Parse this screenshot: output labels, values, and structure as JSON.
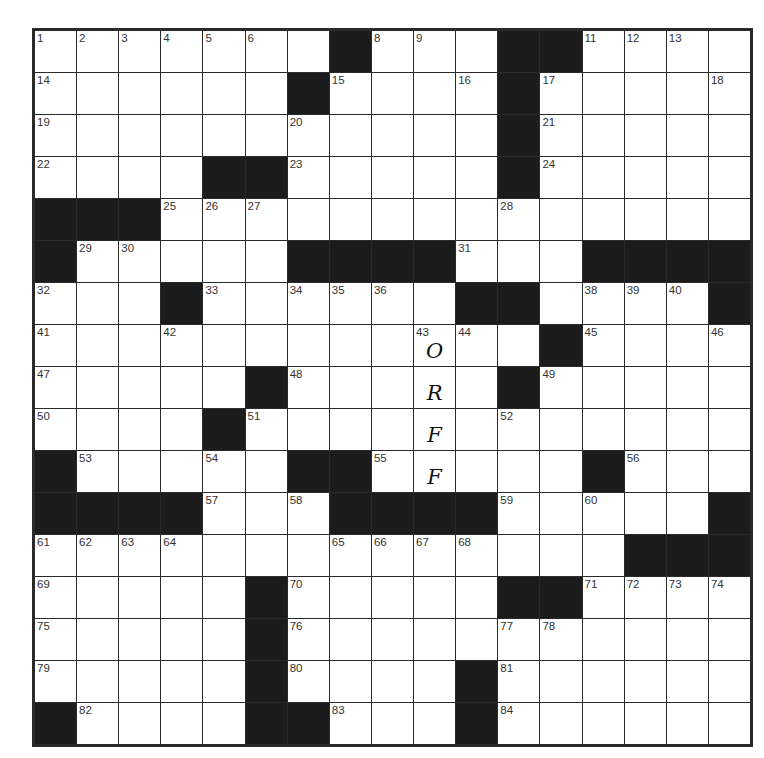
{
  "puzzle": {
    "rows": 17,
    "cols": 17,
    "colors": {
      "block": "#1c1c1c",
      "cell": "#ffffff",
      "line": "#2a2a2a"
    },
    "layout": [
      ".......#...##....#",
      "......#....#.....",
      "...........#.....",
      "....##.....#.....",
      "###..............",
      "#.....####...####",
      "...#......##....#",
      "............#....",
      ".....#.....#.....",
      "....#............",
      "#.....##.....#...",
      "####...####.....#",
      "..............###",
      ".....#.....##....",
      ".....#...........",
      ".....#....#......",
      "#....##...#......"
    ],
    "numbers": [
      {
        "r": 0,
        "c": 0,
        "n": "1"
      },
      {
        "r": 0,
        "c": 1,
        "n": "2"
      },
      {
        "r": 0,
        "c": 2,
        "n": "3"
      },
      {
        "r": 0,
        "c": 3,
        "n": "4"
      },
      {
        "r": 0,
        "c": 4,
        "n": "5"
      },
      {
        "r": 0,
        "c": 5,
        "n": "6"
      },
      {
        "r": 0,
        "c": 7,
        "n": "7"
      },
      {
        "r": 0,
        "c": 8,
        "n": "8"
      },
      {
        "r": 0,
        "c": 9,
        "n": "9"
      },
      {
        "r": 0,
        "c": 12,
        "n": "10"
      },
      {
        "r": 0,
        "c": 13,
        "n": "11"
      },
      {
        "r": 0,
        "c": 14,
        "n": "12"
      },
      {
        "r": 0,
        "c": 15,
        "n": "13"
      },
      {
        "r": 1,
        "c": 0,
        "n": "14"
      },
      {
        "r": 1,
        "c": 7,
        "n": "15"
      },
      {
        "r": 1,
        "c": 10,
        "n": "16"
      },
      {
        "r": 1,
        "c": 12,
        "n": "17"
      },
      {
        "r": 1,
        "c": 16,
        "n": "18"
      },
      {
        "r": 2,
        "c": 0,
        "n": "19"
      },
      {
        "r": 2,
        "c": 6,
        "n": "20"
      },
      {
        "r": 2,
        "c": 12,
        "n": "21"
      },
      {
        "r": 3,
        "c": 0,
        "n": "22"
      },
      {
        "r": 3,
        "c": 6,
        "n": "23"
      },
      {
        "r": 3,
        "c": 12,
        "n": "24"
      },
      {
        "r": 4,
        "c": 3,
        "n": "25"
      },
      {
        "r": 4,
        "c": 4,
        "n": "26"
      },
      {
        "r": 4,
        "c": 5,
        "n": "27"
      },
      {
        "r": 4,
        "c": 11,
        "n": "28"
      },
      {
        "r": 5,
        "c": 1,
        "n": "29"
      },
      {
        "r": 5,
        "c": 2,
        "n": "30"
      },
      {
        "r": 5,
        "c": 10,
        "n": "31"
      },
      {
        "r": 6,
        "c": 0,
        "n": "32"
      },
      {
        "r": 6,
        "c": 4,
        "n": "33"
      },
      {
        "r": 6,
        "c": 6,
        "n": "34"
      },
      {
        "r": 6,
        "c": 7,
        "n": "35"
      },
      {
        "r": 6,
        "c": 8,
        "n": "36"
      },
      {
        "r": 6,
        "c": 11,
        "n": "37"
      },
      {
        "r": 6,
        "c": 13,
        "n": "38"
      },
      {
        "r": 6,
        "c": 14,
        "n": "39"
      },
      {
        "r": 6,
        "c": 15,
        "n": "40"
      },
      {
        "r": 7,
        "c": 0,
        "n": "41"
      },
      {
        "r": 7,
        "c": 3,
        "n": "42"
      },
      {
        "r": 7,
        "c": 9,
        "n": "43"
      },
      {
        "r": 7,
        "c": 10,
        "n": "44"
      },
      {
        "r": 7,
        "c": 13,
        "n": "45"
      },
      {
        "r": 7,
        "c": 16,
        "n": "46"
      },
      {
        "r": 8,
        "c": 0,
        "n": "47"
      },
      {
        "r": 8,
        "c": 6,
        "n": "48"
      },
      {
        "r": 8,
        "c": 12,
        "n": "49"
      },
      {
        "r": 9,
        "c": 0,
        "n": "50"
      },
      {
        "r": 9,
        "c": 5,
        "n": "51"
      },
      {
        "r": 9,
        "c": 11,
        "n": "52"
      },
      {
        "r": 10,
        "c": 1,
        "n": "53"
      },
      {
        "r": 10,
        "c": 4,
        "n": "54"
      },
      {
        "r": 10,
        "c": 8,
        "n": "55"
      },
      {
        "r": 10,
        "c": 14,
        "n": "56"
      },
      {
        "r": 11,
        "c": 4,
        "n": "57"
      },
      {
        "r": 11,
        "c": 6,
        "n": "58"
      },
      {
        "r": 11,
        "c": 11,
        "n": "59"
      },
      {
        "r": 11,
        "c": 13,
        "n": "60"
      },
      {
        "r": 12,
        "c": 0,
        "n": "61"
      },
      {
        "r": 12,
        "c": 1,
        "n": "62"
      },
      {
        "r": 12,
        "c": 2,
        "n": "63"
      },
      {
        "r": 12,
        "c": 3,
        "n": "64"
      },
      {
        "r": 12,
        "c": 7,
        "n": "65"
      },
      {
        "r": 12,
        "c": 8,
        "n": "66"
      },
      {
        "r": 12,
        "c": 9,
        "n": "67"
      },
      {
        "r": 12,
        "c": 10,
        "n": "68"
      },
      {
        "r": 13,
        "c": 0,
        "n": "69"
      },
      {
        "r": 13,
        "c": 6,
        "n": "70"
      },
      {
        "r": 13,
        "c": 13,
        "n": "71"
      },
      {
        "r": 13,
        "c": 14,
        "n": "72"
      },
      {
        "r": 13,
        "c": 15,
        "n": "73"
      },
      {
        "r": 13,
        "c": 16,
        "n": "74"
      },
      {
        "r": 14,
        "c": 0,
        "n": "75"
      },
      {
        "r": 14,
        "c": 6,
        "n": "76"
      },
      {
        "r": 14,
        "c": 11,
        "n": "77"
      },
      {
        "r": 14,
        "c": 12,
        "n": "78"
      },
      {
        "r": 15,
        "c": 0,
        "n": "79"
      },
      {
        "r": 15,
        "c": 6,
        "n": "80"
      },
      {
        "r": 15,
        "c": 11,
        "n": "81"
      },
      {
        "r": 16,
        "c": 1,
        "n": "82"
      },
      {
        "r": 16,
        "c": 7,
        "n": "83"
      },
      {
        "r": 16,
        "c": 11,
        "n": "84"
      }
    ],
    "entries": [
      {
        "r": 7,
        "c": 9,
        "letter": "O"
      },
      {
        "r": 8,
        "c": 9,
        "letter": "R"
      },
      {
        "r": 9,
        "c": 9,
        "letter": "F"
      },
      {
        "r": 10,
        "c": 9,
        "letter": "F"
      }
    ]
  }
}
